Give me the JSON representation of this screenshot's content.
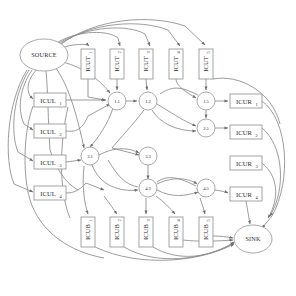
{
  "diagram": {
    "background_color": "#ffffff",
    "edge_color": "#8a8a8a",
    "node_fill": "#ffffff",
    "node_stroke": "#9a9a9a",
    "text_color": "#2a2a2a"
  },
  "terminals": [
    {
      "id": "source",
      "label": "SOURCE",
      "cx": 44,
      "cy": 55,
      "rx": 24,
      "ry": 16
    },
    {
      "id": "sink",
      "label": "SINK",
      "cx": 253,
      "cy": 239,
      "rx": 19,
      "ry": 14
    }
  ],
  "circle_nodes": [
    {
      "id": "n11",
      "label": "1.1",
      "cx": 117,
      "cy": 101,
      "r": 9
    },
    {
      "id": "n12",
      "label": "1.2",
      "cx": 148,
      "cy": 101,
      "r": 9
    },
    {
      "id": "n15",
      "label": "1.5",
      "cx": 206,
      "cy": 101,
      "r": 9
    },
    {
      "id": "n25",
      "label": "2.5",
      "cx": 206,
      "cy": 128,
      "r": 9
    },
    {
      "id": "n31",
      "label": "3.1",
      "cx": 90,
      "cy": 156,
      "r": 9
    },
    {
      "id": "n33",
      "label": "3.3",
      "cx": 148,
      "cy": 156,
      "r": 9
    },
    {
      "id": "n43",
      "label": "4.3",
      "cx": 148,
      "cy": 188,
      "r": 9
    },
    {
      "id": "n45",
      "label": "4.5",
      "cx": 206,
      "cy": 188,
      "r": 9
    }
  ],
  "cut_top": {
    "group_label": "ICUT",
    "orientation": "vertical",
    "boxes": [
      {
        "id": "icut1",
        "label": "ICUT",
        "sub": "1",
        "x": 81,
        "y": 49,
        "w": 14,
        "h": 30
      },
      {
        "id": "icut2",
        "label": "ICUT",
        "sub": "2",
        "x": 110,
        "y": 49,
        "w": 14,
        "h": 30
      },
      {
        "id": "icut3",
        "label": "ICUT",
        "sub": "3",
        "x": 139,
        "y": 49,
        "w": 14,
        "h": 30
      },
      {
        "id": "icut4",
        "label": "ICUT",
        "sub": "4",
        "x": 169,
        "y": 49,
        "w": 14,
        "h": 30
      },
      {
        "id": "icut5",
        "label": "ICUT",
        "sub": "5",
        "x": 199,
        "y": 49,
        "w": 14,
        "h": 30
      }
    ]
  },
  "cut_left": {
    "group_label": "ICUL",
    "orientation": "horizontal",
    "boxes": [
      {
        "id": "icul1",
        "label": "ICUL",
        "sub": "1",
        "x": 34,
        "y": 93,
        "w": 32,
        "h": 14
      },
      {
        "id": "icul2",
        "label": "ICUL",
        "sub": "2",
        "x": 34,
        "y": 124,
        "w": 32,
        "h": 14
      },
      {
        "id": "icul3",
        "label": "ICUL",
        "sub": "3",
        "x": 34,
        "y": 155,
        "w": 32,
        "h": 14
      },
      {
        "id": "icul4",
        "label": "ICUL",
        "sub": "4",
        "x": 34,
        "y": 186,
        "w": 32,
        "h": 14
      }
    ]
  },
  "cut_right": {
    "group_label": "ICUR",
    "orientation": "horizontal",
    "boxes": [
      {
        "id": "icur1",
        "label": "ICUR",
        "sub": "1",
        "x": 230,
        "y": 94,
        "w": 32,
        "h": 14
      },
      {
        "id": "icur2",
        "label": "ICUR",
        "sub": "2",
        "x": 230,
        "y": 125,
        "w": 32,
        "h": 14
      },
      {
        "id": "icur3",
        "label": "ICUR",
        "sub": "3",
        "x": 230,
        "y": 156,
        "w": 32,
        "h": 14
      },
      {
        "id": "icur4",
        "label": "ICUR",
        "sub": "4",
        "x": 230,
        "y": 187,
        "w": 32,
        "h": 14
      }
    ]
  },
  "cut_bottom": {
    "group_label": "ICUB",
    "orientation": "vertical",
    "boxes": [
      {
        "id": "icub1",
        "label": "ICUB",
        "sub": "1",
        "x": 81,
        "y": 217,
        "w": 14,
        "h": 30
      },
      {
        "id": "icub2",
        "label": "ICUB",
        "sub": "2",
        "x": 110,
        "y": 217,
        "w": 14,
        "h": 30
      },
      {
        "id": "icub3",
        "label": "ICUB",
        "sub": "3",
        "x": 139,
        "y": 217,
        "w": 14,
        "h": 30
      },
      {
        "id": "icub4",
        "label": "ICUB",
        "sub": "4",
        "x": 169,
        "y": 217,
        "w": 14,
        "h": 30
      },
      {
        "id": "icub5",
        "label": "ICUB",
        "sub": "5",
        "x": 199,
        "y": 217,
        "w": 14,
        "h": 30
      }
    ]
  },
  "edge_count": 46
}
